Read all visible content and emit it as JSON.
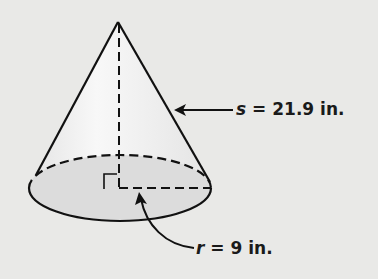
{
  "figure": {
    "shape": "cone",
    "slant_label": {
      "variable": "s",
      "equals": " = ",
      "value": "21.9 in."
    },
    "radius_label": {
      "variable": "r",
      "equals": " = ",
      "value": "9 in."
    },
    "right_angle_marker": true
  },
  "colors": {
    "background": "#e9e9e7",
    "base_fill": "#dcdcdc",
    "stroke": "#111111"
  }
}
